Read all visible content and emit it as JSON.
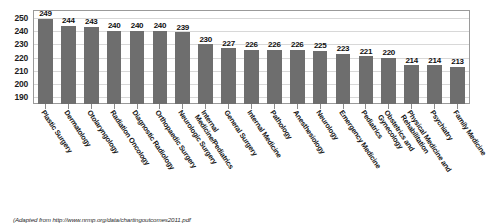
{
  "chart_data": {
    "type": "bar",
    "title": "",
    "xlabel": "",
    "ylabel": "",
    "ylim": [
      185,
      255
    ],
    "yticks": [
      190,
      200,
      210,
      220,
      230,
      240,
      250
    ],
    "grid": true,
    "legend": "none",
    "bar_color": "#6e6e6e",
    "categories": [
      "Plastic Surgery",
      "Dermatology",
      "Otolaryngology",
      "Radiation Oncology",
      "Diagnostic Radiology",
      "Orthopaedic Surgery",
      "Neurologic Surgery",
      "Internal Medicine/Pediatrics",
      "General Surgery",
      "Internal Medicine",
      "Pathology",
      "Anesthesiology",
      "Neurology",
      "Emergency Medicine",
      "Pediatrics",
      "Obstetrics and Gynecology",
      "Physical Medicine and Rehabilitation",
      "Psychiatry",
      "Family Medicine"
    ],
    "values": [
      249,
      244,
      243,
      240,
      240,
      240,
      239,
      230,
      227,
      226,
      226,
      226,
      225,
      223,
      221,
      220,
      214,
      214,
      213
    ],
    "value_labels": [
      "249",
      "244",
      "243",
      "240",
      "240",
      "240",
      "239",
      "230",
      "227",
      "226",
      "226",
      "226",
      "225",
      "223",
      "221",
      "220",
      "214",
      "214",
      "213"
    ]
  },
  "footer": {
    "source": "(Adapted from http://www.nrmp.org/data/chartingoutcomes2011.pdf"
  }
}
